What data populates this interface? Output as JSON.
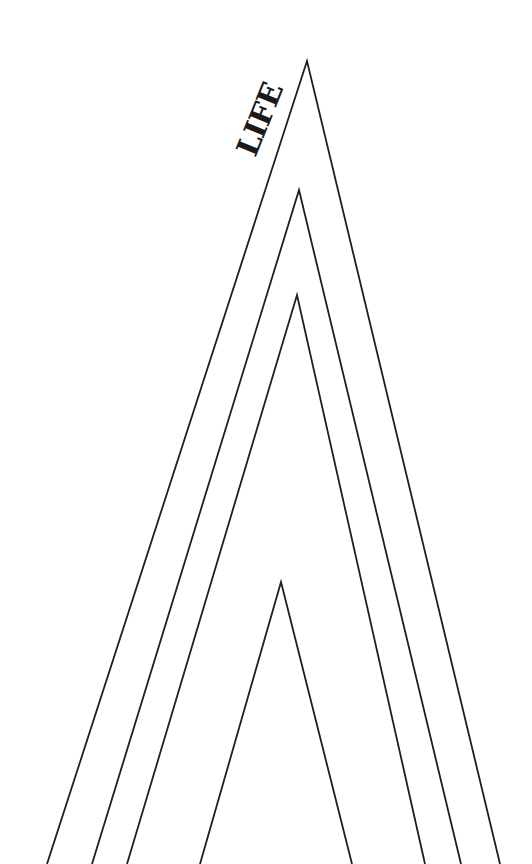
{
  "diagram": {
    "label": "LIFE",
    "stroke_color": "#1f1f1f",
    "background": "#ffffff",
    "arches": [
      {
        "name": "outer",
        "apex": [
          307,
          61
        ],
        "left": [
          47,
          864
        ],
        "right": [
          500,
          864
        ]
      },
      {
        "name": "second",
        "apex": [
          299,
          190
        ],
        "left": [
          92,
          864
        ],
        "right": [
          461,
          864
        ]
      },
      {
        "name": "third",
        "apex": [
          297,
          295
        ],
        "left": [
          127,
          864
        ],
        "right": [
          425,
          864
        ]
      },
      {
        "name": "inner",
        "apex": [
          281,
          582
        ],
        "left": [
          200,
          864
        ],
        "right": [
          352,
          864
        ]
      }
    ]
  }
}
